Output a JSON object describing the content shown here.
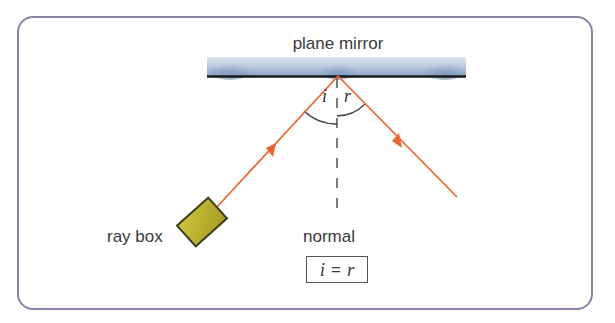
{
  "diagram": {
    "title": "plane mirror",
    "labels": {
      "mirror": "plane mirror",
      "ray_box": "ray box",
      "normal": "normal",
      "angle_incidence": "i",
      "angle_reflection": "r"
    },
    "law": {
      "left": "i",
      "operator": "=",
      "right": "r"
    },
    "colors": {
      "frame": "#8a83a6",
      "ray": "#f0622a",
      "ray_box_fill": "#b5ad2a",
      "mirror_surface": "#1a1a1a",
      "mirror_glass": "#a9bdd6",
      "normal_line": "#444444",
      "text": "#3a3a3a"
    },
    "geometry": {
      "reflection_point": [
        338,
        76
      ],
      "incident_start": [
        216,
        208
      ],
      "reflected_end": [
        457,
        197
      ],
      "normal_x": 337
    }
  }
}
